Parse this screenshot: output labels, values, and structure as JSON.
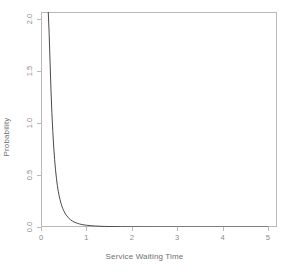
{
  "chart_data": {
    "type": "line",
    "title": "",
    "xlabel": "Service Waiting Time",
    "ylabel": "Probability",
    "xlim": [
      0,
      5.2
    ],
    "ylim": [
      0,
      2.07
    ],
    "grid": false,
    "legend": null,
    "xticks": [
      "0",
      "1",
      "2",
      "3",
      "4",
      "5"
    ],
    "xtick_values": [
      0,
      1,
      2,
      3,
      4,
      5
    ],
    "yticks": [
      "0.0",
      "0.5",
      "1.0",
      "1.5",
      "2.0"
    ],
    "ytick_values": [
      0.0,
      0.5,
      1.0,
      1.5,
      2.0
    ],
    "line_color": "#4a4a4a",
    "axis_color": "#b9b9b9",
    "series": [
      {
        "name": "Service waiting time density",
        "x": [
          0.16,
          0.18,
          0.2,
          0.22,
          0.24,
          0.26,
          0.28,
          0.3,
          0.32,
          0.34,
          0.36,
          0.38,
          0.4,
          0.42,
          0.44,
          0.46,
          0.48,
          0.5,
          0.55,
          0.6,
          0.65,
          0.7,
          0.75,
          0.8,
          0.85,
          0.9,
          0.95,
          1.0,
          1.1,
          1.2,
          1.3,
          1.4,
          1.5,
          1.75,
          2.0,
          2.25,
          2.5,
          2.75,
          3.0,
          3.5,
          4.0,
          4.5,
          5.0
        ],
        "y": [
          2.07,
          1.86,
          1.58,
          1.32,
          1.1,
          0.92,
          0.77,
          0.65,
          0.55,
          0.47,
          0.4,
          0.345,
          0.3,
          0.262,
          0.229,
          0.201,
          0.177,
          0.157,
          0.118,
          0.09,
          0.07,
          0.055,
          0.044,
          0.036,
          0.029,
          0.024,
          0.02,
          0.017,
          0.0125,
          0.0094,
          0.0072,
          0.0057,
          0.0045,
          0.0026,
          0.0017,
          0.0011,
          0.0008,
          0.0006,
          0.0004,
          0.0002,
          0.0001,
          0.0001,
          0.0
        ]
      }
    ]
  }
}
